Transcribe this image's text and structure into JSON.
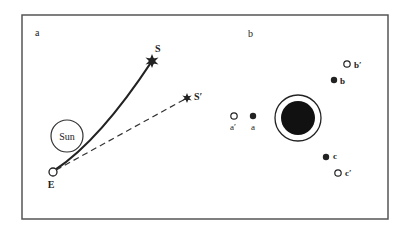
{
  "figure": {
    "panel_a": {
      "label": "a",
      "sun_label": "Sun",
      "earth_label": "E",
      "star_true_label": "S",
      "star_apparent_label": "S′"
    },
    "panel_b": {
      "label": "b",
      "stars": [
        {
          "id": "a",
          "label": "a",
          "type": "filled"
        },
        {
          "id": "a_prime",
          "label": "a′",
          "type": "open"
        },
        {
          "id": "b",
          "label": "b",
          "type": "filled"
        },
        {
          "id": "b_prime",
          "label": "b′",
          "type": "open"
        },
        {
          "id": "c",
          "label": "c",
          "type": "filled"
        },
        {
          "id": "c_prime",
          "label": "c′",
          "type": "open"
        }
      ]
    },
    "colors": {
      "ink": "#222222",
      "border": "#555555",
      "background": "#ffffff"
    }
  }
}
